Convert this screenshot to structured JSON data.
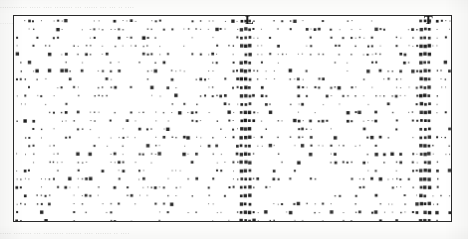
{
  "figure": {
    "type": "scatter-dot-matrix",
    "frame": {
      "x": 13,
      "y": 15,
      "width": 439,
      "height": 207,
      "border_color": "#2a2a2a",
      "border_width": 1.6
    },
    "background_color": "#ffffff",
    "dot_color": "#1a1a1a",
    "ghost_text_color": "#d7d7d4",
    "labels": [
      {
        "text": "L",
        "x": 245,
        "y": 13,
        "name": "column-label-l"
      },
      {
        "text": "T",
        "x": 424,
        "y": 13,
        "name": "column-label-t"
      }
    ],
    "ghost_top": "............ ..... .... ........ ... ...... ... ... .. ....",
    "ghost_top_2": "    ....... .... ... ...... ... ..... ....",
    "ghost_bottom": "..... ........ ... ......... ....... .... ....... .. ...."
  },
  "chart_data": {
    "type": "scatter",
    "title": "",
    "subtitle": "",
    "xlabel": "",
    "ylabel": "",
    "grid": false,
    "legend": null,
    "xlim": [
      0,
      439
    ],
    "ylim": [
      0,
      207
    ],
    "lattice": {
      "x_pitch": 4.1,
      "y_pitch": 8.4,
      "x_offset": 3.0,
      "y_offset": 5.0
    },
    "marker_sizes_px": [
      0.9,
      1.4,
      2.0,
      2.7,
      3.4
    ],
    "density": 0.27,
    "annotations": [
      {
        "label": "L",
        "x_px": 232,
        "note": "dense vertical marker column"
      },
      {
        "label": "T",
        "x_px": 411,
        "note": "dense vertical marker column"
      }
    ],
    "series": [
      {
        "name": "marks",
        "values": []
      }
    ]
  }
}
